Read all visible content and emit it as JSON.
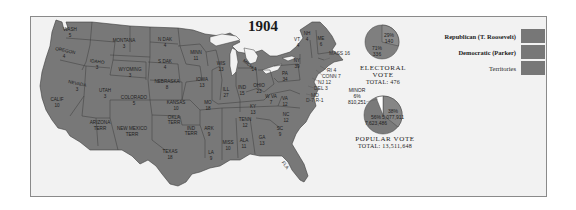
{
  "title": "1904",
  "colors": {
    "background": "#f2f2f2",
    "state_fill": "#787878",
    "state_border": "#3a3a3a",
    "water": "#f2f2f2",
    "republican": "#787878",
    "democratic": "#777777",
    "territories": "#7a7a7a",
    "pie_republican": "#868686",
    "pie_democratic": "#7b7b7b",
    "pie_minor": "#ffffff"
  },
  "legend": {
    "items": [
      {
        "label": "Republican (T. Roosevelt)",
        "bold": true,
        "color": "#787878"
      },
      {
        "label": "Democratic (Parker)",
        "bold": true,
        "color": "#777777"
      },
      {
        "label": "Territories",
        "bold": false,
        "color": "#7a7a7a"
      }
    ]
  },
  "electoral_vote": {
    "heading": "ELECTORAL VOTE",
    "total_label": "TOTAL: 476",
    "slices": [
      {
        "party": "Republican",
        "pct": "71%",
        "value": "336"
      },
      {
        "party": "Democratic",
        "pct": "29%",
        "value": "140"
      }
    ]
  },
  "popular_vote": {
    "heading": "POPULAR VOTE",
    "total_label": "TOTAL: 13,511,648",
    "slices": [
      {
        "party": "Republican",
        "pct": "56%",
        "value": "7,623,486"
      },
      {
        "party": "Democratic",
        "pct": "38%",
        "value": "5,077,911"
      },
      {
        "party": "Minor",
        "label": "MINOR",
        "pct": "6%",
        "value": "810,251"
      }
    ]
  },
  "states": [
    {
      "name": "WASH",
      "ev": "5"
    },
    {
      "name": "OREGON",
      "ev": "4"
    },
    {
      "name": "CALIF",
      "ev": "10"
    },
    {
      "name": "IDAHO",
      "ev": "3"
    },
    {
      "name": "NEVADA",
      "ev": "3"
    },
    {
      "name": "MONTANA",
      "ev": "3"
    },
    {
      "name": "WYOMING",
      "ev": "3"
    },
    {
      "name": "UTAH",
      "ev": "3"
    },
    {
      "name": "COLORADO",
      "ev": "5"
    },
    {
      "name": "ARIZONA",
      "ev": "TERR"
    },
    {
      "name": "NEW MEXICO",
      "ev": "TERR"
    },
    {
      "name": "N DAK",
      "ev": "4"
    },
    {
      "name": "S DAK",
      "ev": "4"
    },
    {
      "name": "NEBRASKA",
      "ev": "8"
    },
    {
      "name": "KANSAS",
      "ev": "10"
    },
    {
      "name": "OKLA",
      "ev": "TERR"
    },
    {
      "name": "IND",
      "ev": "TERR"
    },
    {
      "name": "TEXAS",
      "ev": "18"
    },
    {
      "name": "MINN",
      "ev": "11"
    },
    {
      "name": "IOWA",
      "ev": "13"
    },
    {
      "name": "MO",
      "ev": "18"
    },
    {
      "name": "ARK",
      "ev": "9"
    },
    {
      "name": "LA",
      "ev": "9"
    },
    {
      "name": "WIS",
      "ev": "13"
    },
    {
      "name": "ILL",
      "ev": "27"
    },
    {
      "name": "MICH",
      "ev": "14"
    },
    {
      "name": "IND",
      "ev": "15"
    },
    {
      "name": "OHIO",
      "ev": "23"
    },
    {
      "name": "KY",
      "ev": "13"
    },
    {
      "name": "TENN",
      "ev": "12"
    },
    {
      "name": "MISS",
      "ev": "10"
    },
    {
      "name": "ALA",
      "ev": "11"
    },
    {
      "name": "GA",
      "ev": "13"
    },
    {
      "name": "FLA",
      "ev": "5"
    },
    {
      "name": "SC",
      "ev": "9"
    },
    {
      "name": "NC",
      "ev": "12"
    },
    {
      "name": "VA",
      "ev": "12"
    },
    {
      "name": "W VA",
      "ev": "7"
    },
    {
      "name": "PA",
      "ev": "34"
    },
    {
      "name": "NY",
      "ev": "39"
    },
    {
      "name": "VT",
      "ev": "4"
    },
    {
      "name": "NH",
      "ev": "4"
    },
    {
      "name": "ME",
      "ev": "6"
    },
    {
      "name": "MASS",
      "ev": "16"
    },
    {
      "name": "RI",
      "ev": "4"
    },
    {
      "name": "CONN",
      "ev": "7"
    },
    {
      "name": "NJ",
      "ev": "12"
    },
    {
      "name": "DEL",
      "ev": "3"
    },
    {
      "name": "MD",
      "ev": "D-7 R-1"
    }
  ],
  "east_callouts": [
    {
      "text": "MASS 16"
    },
    {
      "text": "RI 4"
    },
    {
      "text": "CONN 7"
    },
    {
      "text": "NJ 12"
    },
    {
      "text": "DEL 3"
    },
    {
      "text": "MD"
    },
    {
      "text": "D-7 R-1"
    }
  ]
}
